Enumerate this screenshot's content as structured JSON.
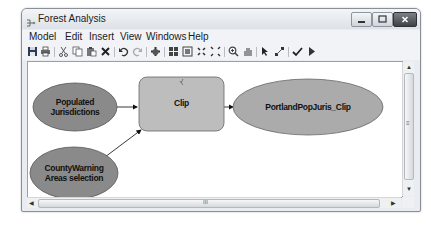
{
  "window": {
    "title": "Forest Analysis",
    "controls": [
      "minimize",
      "maximize",
      "close"
    ]
  },
  "menubar": {
    "items": [
      "Model",
      "Edit",
      "Insert",
      "View",
      "Windows",
      "Help"
    ]
  },
  "toolbar": {
    "tools": [
      {
        "name": "save-icon"
      },
      {
        "name": "print-icon"
      },
      {
        "name": "cut-icon"
      },
      {
        "name": "copy-icon"
      },
      {
        "name": "paste-icon"
      },
      {
        "name": "delete-icon"
      },
      {
        "name": "undo-icon"
      },
      {
        "name": "redo-icon"
      },
      {
        "name": "add-data-icon"
      },
      {
        "name": "auto-layout-icon"
      },
      {
        "name": "full-extent-icon"
      },
      {
        "name": "zoom-in-fixed-icon"
      },
      {
        "name": "zoom-out-fixed-icon"
      },
      {
        "name": "zoom-icon"
      },
      {
        "name": "pan-icon"
      },
      {
        "name": "select-icon"
      },
      {
        "name": "connect-icon"
      },
      {
        "name": "validate-icon"
      },
      {
        "name": "run-icon"
      }
    ]
  },
  "diagram": {
    "nodes": [
      {
        "id": "populated",
        "label_line1": "Populated",
        "label_line2": "Jurisdictions",
        "type": "input-data",
        "fill": "#8a8a8a"
      },
      {
        "id": "countywarning",
        "label_line1": "CountyWarning",
        "label_line2": "Areas selection",
        "type": "input-data",
        "fill": "#8a8a8a"
      },
      {
        "id": "clip",
        "label": "Clip",
        "type": "tool",
        "fill": "#bdbdbd"
      },
      {
        "id": "output",
        "label": "PortlandPopJuris_Clip",
        "type": "output-data",
        "fill": "#ababab"
      }
    ],
    "connections": [
      {
        "from": "populated",
        "to": "clip"
      },
      {
        "from": "countywarning",
        "to": "clip"
      },
      {
        "from": "clip",
        "to": "output"
      }
    ]
  },
  "scrollbars": {
    "vertical_grip": "≡",
    "horizontal_grip": "III"
  }
}
